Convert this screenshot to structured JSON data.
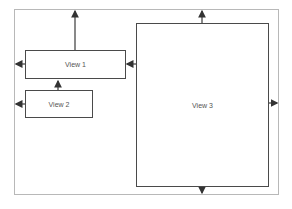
{
  "diagram": {
    "frame": {
      "x": 14,
      "y": 9,
      "w": 265,
      "h": 186
    },
    "views": [
      {
        "label": "View 1",
        "x": 25,
        "y": 50,
        "w": 100,
        "h": 29
      },
      {
        "label": "View 2",
        "x": 25,
        "y": 90,
        "w": 67,
        "h": 28
      },
      {
        "label": "View 3",
        "x": 136,
        "y": 23,
        "w": 132,
        "h": 163
      }
    ],
    "colors": {
      "stroke": "#4a4a4a",
      "frame": "#b8b8b8",
      "text": "#555555"
    }
  }
}
